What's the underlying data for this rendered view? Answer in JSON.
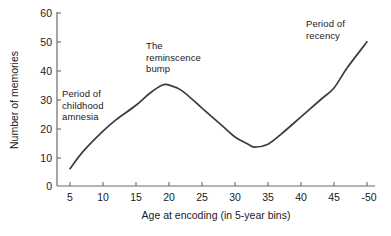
{
  "chart_data": {
    "type": "line",
    "title": "",
    "xlabel": "Age at encoding (in 5-year bins)",
    "ylabel": "Number of memories",
    "xlim": [
      5,
      50
    ],
    "ylim": [
      0,
      60
    ],
    "xticks": [
      "5",
      "10",
      "15",
      "20",
      "25",
      "30",
      "35",
      "40",
      "45",
      "-50"
    ],
    "xtick_values": [
      5,
      10,
      15,
      20,
      25,
      30,
      35,
      40,
      45,
      50
    ],
    "yticks": [
      "0",
      "10",
      "20",
      "30",
      "40",
      "50",
      "60"
    ],
    "ytick_values": [
      0,
      10,
      20,
      30,
      40,
      50,
      60
    ],
    "grid": false,
    "legend": false,
    "series": [
      {
        "name": "Number of memories",
        "color": "#3c3c3c",
        "x": [
          5,
          7,
          10,
          12,
          15,
          17,
          19,
          20,
          22,
          25,
          28,
          30,
          32,
          33,
          35,
          37,
          40,
          43,
          45,
          47,
          50
        ],
        "values": [
          6,
          12,
          19,
          23,
          28,
          32,
          35,
          35,
          33,
          27,
          21,
          17,
          14.5,
          13.5,
          14.5,
          18,
          24,
          30,
          34,
          41,
          50
        ]
      }
    ],
    "annotations": [
      {
        "id": "childhood",
        "text": "Period of\nchildhood\namnesia",
        "x": 7.5,
        "y": 31
      },
      {
        "id": "bump",
        "text": "The\nreminscence\nbump",
        "x": 18.5,
        "y": 48
      },
      {
        "id": "recency",
        "text": "Period of\nrecency",
        "x": 42.5,
        "y": 55
      }
    ]
  }
}
